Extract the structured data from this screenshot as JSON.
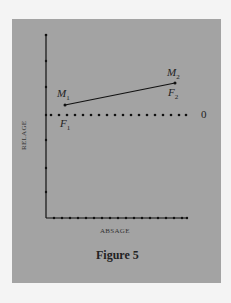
{
  "figure": {
    "caption": "Figure 5",
    "x_axis_label": "ABSAGE",
    "y_axis_label": "RELAGE",
    "zero_label": "0",
    "points": [
      {
        "name": "M",
        "sub": "1",
        "label": "M1",
        "secondary": "F",
        "secondary_sub": "1",
        "secondary_label": "F1"
      },
      {
        "name": "M",
        "sub": "2",
        "label": "M2",
        "secondary": "F",
        "secondary_sub": "2",
        "secondary_label": "F2"
      }
    ],
    "colors": {
      "panel": "#a3a3a3",
      "ink": "#222222"
    }
  }
}
